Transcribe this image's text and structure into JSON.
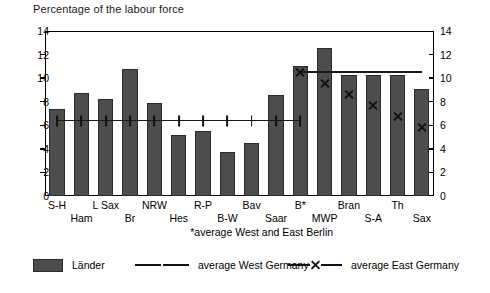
{
  "chart_data": {
    "type": "bar",
    "title": "Percentage of the labour force",
    "xlabel": "",
    "ylabel": "",
    "ylim": [
      0,
      14
    ],
    "yticks": [
      0,
      2,
      4,
      6,
      8,
      10,
      12,
      14
    ],
    "dual_axis": true,
    "grid": false,
    "legend_position": "bottom",
    "footnote": "*average West and East Berlin",
    "categories": [
      "S-H",
      "Ham",
      "L Sax",
      "Br",
      "NRW",
      "Hes",
      "R-P",
      "B-W",
      "Bav",
      "Saar",
      "B*",
      "MWP",
      "Bran",
      "S-A",
      "Th",
      "Sax"
    ],
    "category_rows": [
      1,
      2,
      1,
      2,
      1,
      2,
      1,
      2,
      1,
      2,
      1,
      2,
      1,
      2,
      1,
      2
    ],
    "series": [
      {
        "name": "Länder",
        "type": "bar",
        "color": "#4d4d4d",
        "values": [
          7.35,
          8.75,
          8.2,
          10.8,
          7.9,
          5.2,
          5.5,
          3.75,
          4.5,
          8.6,
          11.0,
          12.55,
          10.3,
          10.3,
          10.25,
          9.1
        ]
      },
      {
        "name": "average West Germany",
        "type": "line",
        "marker": "vertical-bar",
        "value": 6.4,
        "spans_categories": [
          "S-H",
          "Ham",
          "L Sax",
          "Br",
          "NRW",
          "Hes",
          "R-P",
          "B-W",
          "Bav",
          "Saar",
          "B*"
        ]
      },
      {
        "name": "average East Germany",
        "type": "line",
        "marker": "x",
        "value": 10.5,
        "spans_categories": [
          "B*",
          "MWP",
          "Bran",
          "S-A",
          "Th",
          "Sax"
        ]
      }
    ]
  },
  "legend": {
    "items": [
      {
        "label": "Länder",
        "kind": "swatch"
      },
      {
        "label": "average West Germany",
        "kind": "line-vbar"
      },
      {
        "label": "average East Germany",
        "kind": "line-x"
      }
    ]
  }
}
